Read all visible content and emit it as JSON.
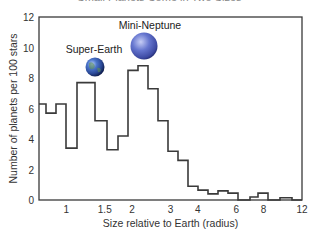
{
  "chart_data": {
    "type": "bar",
    "style": "step-histogram",
    "title": "Small Planets Come in Two Sizes",
    "xlabel": "Size relative to Earth (radius)",
    "ylabel": "Number of planets per 100 stars",
    "xscale": "log",
    "xlim": [
      0.75,
      12
    ],
    "ylim": [
      0,
      12
    ],
    "xticks": [
      1,
      1.5,
      2,
      3,
      4,
      6,
      8,
      12
    ],
    "xtick_labels": [
      "1",
      "1.5",
      "2",
      "3",
      "4",
      "6",
      "8",
      "12"
    ],
    "yticks": [
      0,
      2,
      4,
      6,
      8,
      10,
      12
    ],
    "ytick_labels": [
      "0",
      "2",
      "4",
      "6",
      "8",
      "10",
      "12"
    ],
    "grid": false,
    "bin_edges_px": [
      39,
      46,
      56,
      66,
      77,
      95,
      107,
      118,
      128,
      138,
      148,
      158,
      168,
      178,
      188,
      198,
      208,
      218,
      228,
      238,
      250,
      258,
      268,
      280,
      292,
      302
    ],
    "bin_edges": [
      0.75,
      0.79,
      0.86,
      0.93,
      1.02,
      1.19,
      1.31,
      1.43,
      1.55,
      1.69,
      1.84,
      2.0,
      2.18,
      2.37,
      2.58,
      2.8,
      3.05,
      3.32,
      3.61,
      3.93,
      4.36,
      4.66,
      5.08,
      5.63,
      6.25,
      6.8
    ],
    "values": [
      6.3,
      5.7,
      6.3,
      3.4,
      7.7,
      5.2,
      3.3,
      4.2,
      8.5,
      8.8,
      7.3,
      5.2,
      3.2,
      2.6,
      0.9,
      0.65,
      0.4,
      0.6,
      0.45,
      0.0,
      0.2,
      0.45,
      0.0,
      0.15,
      0.0
    ],
    "annotations": [
      {
        "text": "Super-Earth",
        "x": 1.4,
        "y": 9.2,
        "image": "earth-like-planet"
      },
      {
        "text": "Mini-Neptune",
        "x": 2.4,
        "y": 11.2,
        "image": "neptune-like-planet"
      }
    ],
    "colors": {
      "line": "#3a3a3a",
      "text": "#333333",
      "earth": "#3a5fb0",
      "neptune": "#5a6cc8"
    }
  }
}
